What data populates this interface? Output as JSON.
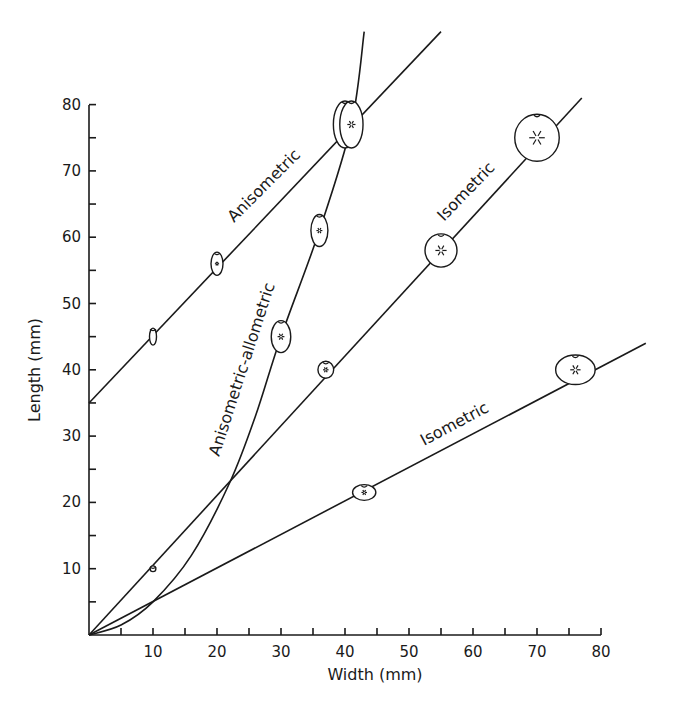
{
  "chart_data": {
    "type": "line",
    "title": "",
    "xlabel": "Width (mm)",
    "ylabel": "Length (mm)",
    "xlim": [
      0,
      80
    ],
    "ylim": [
      0,
      80
    ],
    "x_ticks": [
      10,
      20,
      30,
      40,
      50,
      60,
      70,
      80
    ],
    "y_ticks": [
      10,
      20,
      30,
      40,
      50,
      60,
      70,
      80
    ],
    "minor_tick_step": 5,
    "grid": false,
    "legend": null,
    "series": [
      {
        "name": "Anisometric",
        "kind": "straight line",
        "points": [
          [
            0,
            35
          ],
          [
            10,
            45
          ],
          [
            20,
            56
          ],
          [
            40,
            77
          ],
          [
            55,
            91
          ]
        ],
        "fruit_markers": [
          [
            10,
            45
          ],
          [
            20,
            56
          ],
          [
            40,
            77
          ]
        ]
      },
      {
        "name": "Anisometric-allometric",
        "kind": "curve",
        "points": [
          [
            0,
            0
          ],
          [
            5,
            1.5
          ],
          [
            10,
            5
          ],
          [
            16,
            12
          ],
          [
            22,
            23
          ],
          [
            26,
            33
          ],
          [
            30,
            45
          ],
          [
            36,
            61
          ],
          [
            41,
            77
          ],
          [
            43,
            91
          ]
        ],
        "fruit_markers": [
          [
            10,
            5
          ],
          [
            22,
            23
          ],
          [
            30,
            45
          ],
          [
            36,
            61
          ],
          [
            41,
            77
          ]
        ]
      },
      {
        "name": "Isometric (upper)",
        "label": "Isometric",
        "kind": "straight line",
        "points": [
          [
            0,
            0
          ],
          [
            10,
            10
          ],
          [
            22,
            23
          ],
          [
            37,
            40
          ],
          [
            55,
            58
          ],
          [
            70,
            75
          ],
          [
            77,
            81
          ]
        ],
        "fruit_markers": [
          [
            10,
            10
          ],
          [
            22,
            23
          ],
          [
            37,
            40
          ],
          [
            55,
            58
          ],
          [
            70,
            75
          ]
        ]
      },
      {
        "name": "Isometric (lower)",
        "label": "Isometric",
        "kind": "straight line",
        "points": [
          [
            0,
            0
          ],
          [
            10,
            5
          ],
          [
            43,
            21.5
          ],
          [
            76,
            40
          ],
          [
            87,
            44
          ]
        ],
        "fruit_markers": [
          [
            10,
            5
          ],
          [
            43,
            21.5
          ],
          [
            76,
            40
          ]
        ]
      }
    ],
    "annotations": [
      "Anisometric",
      "Anisometric-allometric",
      "Isometric",
      "Isometric"
    ]
  },
  "axes": {
    "x_title": "Width (mm)",
    "y_title": "Length (mm)",
    "x_tick_labels": [
      "10",
      "20",
      "30",
      "40",
      "50",
      "60",
      "70",
      "80"
    ],
    "y_tick_labels": [
      "10",
      "20",
      "30",
      "40",
      "50",
      "60",
      "70",
      "80"
    ]
  },
  "labels": {
    "anisometric": "Anisometric",
    "anisometric_allometric": "Anisometric-allometric",
    "isometric_upper": "Isometric",
    "isometric_lower": "Isometric"
  }
}
